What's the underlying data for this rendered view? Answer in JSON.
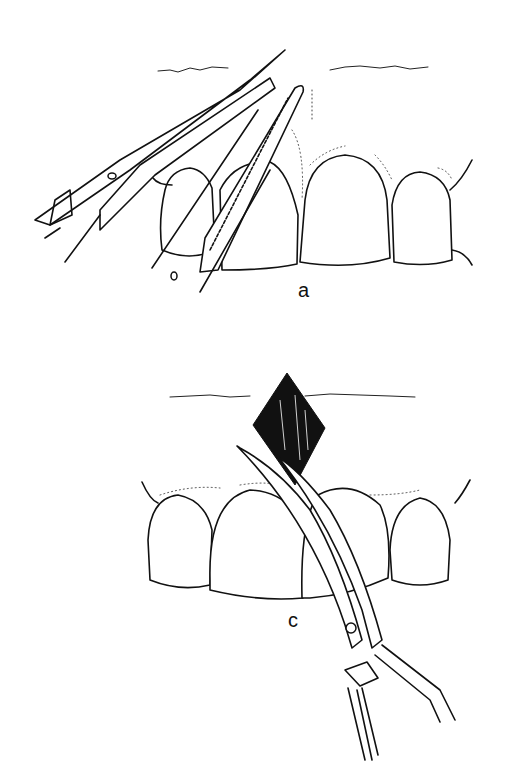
{
  "figure": {
    "panels": [
      {
        "id": "a",
        "label": "a",
        "description": "Curved scissors and serrated tissue forceps excising gingival tissue between anterior teeth"
      },
      {
        "id": "c",
        "label": "c",
        "description": "Curved scissors cutting diamond-shaped frenum tissue between upper central incisors"
      }
    ]
  }
}
